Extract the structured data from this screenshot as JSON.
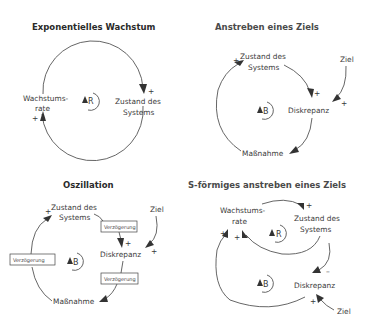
{
  "diagrams": [
    {
      "title": "Exponentielles Wachstum",
      "nodes": {
        "growth_rate_1": "Wachstums-",
        "growth_rate_2": "rate",
        "state_1": "Zustand des",
        "state_2": "Systems"
      },
      "loop": "R",
      "links": [
        {
          "from": "Wachstumsrate",
          "to": "Zustand des Systems",
          "polarity": "+"
        },
        {
          "from": "Zustand des Systems",
          "to": "Wachstumsrate",
          "polarity": "+"
        }
      ],
      "signs": {
        "s1": "+",
        "s2": "+"
      }
    },
    {
      "title": "Anstreben eines Ziels",
      "nodes": {
        "state_1": "Zustand des",
        "state_2": "Systems",
        "goal": "Ziel",
        "discrepancy": "Diskrepanz",
        "action": "Maßnahme"
      },
      "loop": "B",
      "links": [
        {
          "from": "Zustand des Systems",
          "to": "Diskrepanz",
          "polarity": "+"
        },
        {
          "from": "Ziel",
          "to": "Diskrepanz",
          "polarity": "+"
        },
        {
          "from": "Diskrepanz",
          "to": "Maßnahme",
          "polarity": ""
        },
        {
          "from": "Maßnahme",
          "to": "Zustand des Systems",
          "polarity": "+"
        }
      ],
      "signs": {
        "s1": "+",
        "s2": "+",
        "s3": "+"
      }
    },
    {
      "title": "Oszillation",
      "nodes": {
        "state_1": "Zustand des",
        "state_2": "Systems",
        "goal": "Ziel",
        "discrepancy": "Diskrepanz",
        "action": "Maßnahme"
      },
      "delays": [
        "Verzögerung",
        "Verzögerung",
        "Verzögerung"
      ],
      "loop": "B",
      "links": [
        {
          "from": "Zustand des Systems",
          "to": "Diskrepanz",
          "polarity": "+",
          "delay": true
        },
        {
          "from": "Ziel",
          "to": "Diskrepanz",
          "polarity": "+"
        },
        {
          "from": "Diskrepanz",
          "to": "Maßnahme",
          "polarity": "",
          "delay": true
        },
        {
          "from": "Maßnahme",
          "to": "Zustand des Systems",
          "polarity": "+",
          "delay": true
        }
      ],
      "signs": {
        "s1": "+",
        "s2": "+",
        "s3": "+"
      }
    },
    {
      "title": "S-förmiges anstreben eines Ziels",
      "nodes": {
        "growth_rate_1": "Wachstums-",
        "growth_rate_2": "rate",
        "state_1": "Zustand des",
        "state_2": "Systems",
        "discrepancy": "Diskrepanz",
        "goal": "Ziel"
      },
      "loops": [
        "R",
        "B"
      ],
      "links": [
        {
          "from": "Wachstumsrate",
          "to": "Zustand des Systems",
          "polarity": "+"
        },
        {
          "from": "Zustand des Systems",
          "to": "Wachstumsrate",
          "polarity": "+"
        },
        {
          "from": "Zustand des Systems",
          "to": "Diskrepanz",
          "polarity": "-"
        },
        {
          "from": "Ziel",
          "to": "Diskrepanz",
          "polarity": "+"
        },
        {
          "from": "Diskrepanz",
          "to": "Wachstumsrate",
          "polarity": "+"
        }
      ],
      "signs": {
        "s1": "+",
        "s2": "+",
        "s3": "+",
        "s4": "–",
        "s5": "+"
      }
    }
  ]
}
